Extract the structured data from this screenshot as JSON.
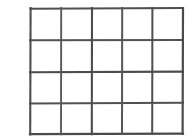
{
  "figure": {
    "name": "blank-grid-table",
    "columns": 5,
    "rows": 4,
    "cell_text": "",
    "background_color": "#ffffff",
    "line_color": "#4d4d4d",
    "line_color_light": "#6e6e6e",
    "line_width": 2,
    "canvas": {
      "width": 196,
      "height": 140
    },
    "grid_bounds": {
      "left": 30,
      "top": 8,
      "right": 183,
      "bottom": 134
    },
    "vertical_line_x": [
      30,
      61,
      92,
      122,
      152,
      183
    ],
    "horizontal_line_y": [
      8,
      40,
      72,
      103,
      134
    ],
    "cells": [
      [
        "",
        "",
        "",
        "",
        ""
      ],
      [
        "",
        "",
        "",
        "",
        ""
      ],
      [
        "",
        "",
        "",
        "",
        ""
      ],
      [
        "",
        "",
        "",
        "",
        ""
      ]
    ]
  }
}
